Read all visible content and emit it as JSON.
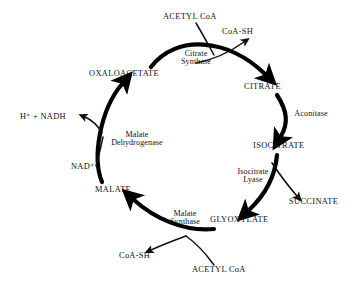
{
  "diagram": {
    "type": "cycle-diagram",
    "background_color": "#ffffff",
    "stroke_color": "#000000",
    "metabolites": [
      {
        "id": "oxaloacetate",
        "label": "OXALOACETATE",
        "x": 126,
        "y": 75
      },
      {
        "id": "citrate",
        "label": "CITRATE",
        "x": 265,
        "y": 88
      },
      {
        "id": "isocitrate",
        "label": "ISOCITRATE",
        "x": 279,
        "y": 147
      },
      {
        "id": "succinate",
        "label": "SUCCINATE",
        "x": 317,
        "y": 203
      },
      {
        "id": "glyoxylate",
        "label": "GLYOXYLATE",
        "x": 241,
        "y": 221
      },
      {
        "id": "malate",
        "label": "MALATE",
        "x": 115,
        "y": 191
      }
    ],
    "enzymes": [
      {
        "id": "citrate-synthase",
        "line1": "Citrate",
        "line2": "Synthase",
        "x": 196,
        "y": 59
      },
      {
        "id": "aconitase",
        "line1": "Aconitase",
        "line2": "",
        "x": 310,
        "y": 114
      },
      {
        "id": "isocitrate-lyase",
        "line1": "Isocitrate",
        "line2": "Lyase",
        "x": 253,
        "y": 177
      },
      {
        "id": "malate-synthase",
        "line1": "Malate",
        "line2": "Synthase",
        "x": 185,
        "y": 219
      },
      {
        "id": "malate-dehydrogenase",
        "line1": "Malate",
        "line2": "Dehydrogenase",
        "x": 137,
        "y": 140
      }
    ],
    "cofactors": [
      {
        "id": "acetyl-coa-top",
        "label": "ACETYL CoA",
        "x": 192,
        "y": 18
      },
      {
        "id": "coa-sh-top",
        "label": "CoA-SH",
        "x": 242,
        "y": 33
      },
      {
        "id": "h-nadh",
        "label": "H⁺ + NADH",
        "x": 47,
        "y": 118
      },
      {
        "id": "nad-plus",
        "label": "NAD⁺",
        "x": 83,
        "y": 168
      },
      {
        "id": "coa-sh-bottom",
        "label": "CoA-SH",
        "x": 139,
        "y": 257
      },
      {
        "id": "acetyl-coa-bottom",
        "label": "ACETYL CoA",
        "x": 221,
        "y": 271
      }
    ]
  }
}
